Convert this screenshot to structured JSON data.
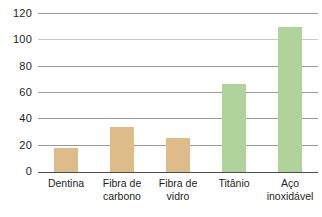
{
  "chart_data": {
    "type": "bar",
    "title": "",
    "xlabel": "",
    "ylabel": "",
    "categories": [
      "Dentina",
      "Fibra de carbono",
      "Fibra de vidro",
      "Titânio",
      "Aço inoxidável"
    ],
    "category_lines": [
      [
        "Dentina"
      ],
      [
        "Fibra de",
        "carbono"
      ],
      [
        "Fibra de",
        "vidro"
      ],
      [
        "Titânio"
      ],
      [
        "Aço",
        "inoxidável"
      ]
    ],
    "values": [
      18,
      34,
      26,
      67,
      110
    ],
    "bar_colors": [
      "#ddbc8a",
      "#ddbc8a",
      "#ddbc8a",
      "#b0d39b",
      "#b0d39b"
    ],
    "ylim": [
      0,
      120
    ],
    "yticks": [
      0,
      20,
      40,
      60,
      80,
      100,
      120
    ],
    "ytick_labels": [
      "0",
      "20",
      "40",
      "60",
      "80",
      "100",
      "120"
    ],
    "grid": true,
    "grid_axis": "y",
    "legend": "none"
  },
  "colors": {
    "tan": "#ddbc8a",
    "green": "#b0d39b",
    "gridline": "#9a9a9a",
    "gridline_faint": "#c9c9c9",
    "baseline": "#4d4d4d",
    "text": "#231f20",
    "background": "#ffffff"
  }
}
